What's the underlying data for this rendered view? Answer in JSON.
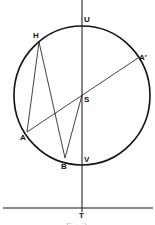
{
  "figure": {
    "caption": "Fig. 2",
    "stroke_color": "#111111",
    "circle": {
      "cx": 82,
      "cy": 95.5,
      "rx": 68,
      "ry": 69.5
    },
    "points": {
      "U": {
        "label": "U",
        "x": 82,
        "y": 26
      },
      "H": {
        "label": "H",
        "x": 39,
        "y": 42
      },
      "A_prime": {
        "label": "A′",
        "x": 138,
        "y": 58
      },
      "S": {
        "label": "S",
        "x": 82,
        "y": 95
      },
      "A": {
        "label": "A",
        "x": 27,
        "y": 132
      },
      "B": {
        "label": "B",
        "x": 65,
        "y": 158
      },
      "V": {
        "label": "V",
        "x": 82,
        "y": 165
      },
      "T": {
        "label": "T",
        "x": 82,
        "y": 208
      }
    },
    "segments": [
      [
        "A",
        "A_prime"
      ],
      [
        "A",
        "H"
      ],
      [
        "H",
        "B"
      ],
      [
        "B",
        "S"
      ]
    ]
  }
}
